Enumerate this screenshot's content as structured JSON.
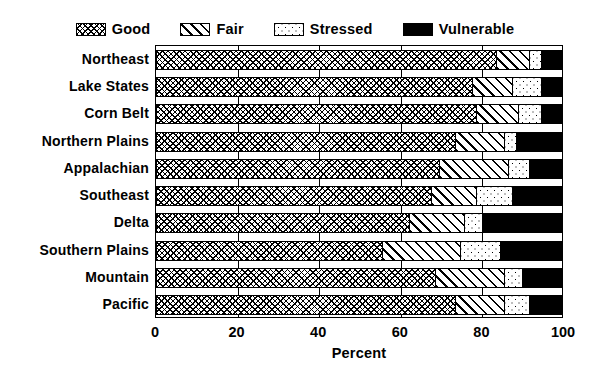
{
  "chart_data": {
    "type": "bar",
    "orientation": "horizontal",
    "stacked": true,
    "title": "",
    "xlabel": "Percent",
    "ylabel": "",
    "xlim": [
      0,
      100
    ],
    "xticks": [
      0,
      20,
      40,
      60,
      80,
      100
    ],
    "grid": true,
    "legend_position": "top",
    "categories": [
      "Northeast",
      "Lake States",
      "Corn Belt",
      "Northern Plains",
      "Appalachian",
      "Southeast",
      "Delta",
      "Southern Plains",
      "Mountain",
      "Pacific"
    ],
    "series": [
      {
        "name": "Good",
        "pattern": "crosshatch",
        "values": [
          84,
          78,
          79,
          74,
          70,
          68,
          62.5,
          56,
          69,
          74
        ]
      },
      {
        "name": "Fair",
        "pattern": "diagonal-lines",
        "values": [
          8,
          10,
          10.5,
          12,
          17,
          11,
          13.5,
          19,
          17,
          12
        ]
      },
      {
        "name": "Stressed",
        "pattern": "dots",
        "values": [
          3,
          7,
          5.5,
          3,
          5,
          9,
          4.5,
          10,
          4.5,
          6
        ]
      },
      {
        "name": "Vulnerable",
        "pattern": "solid-black",
        "values": [
          5,
          5,
          5,
          11,
          8,
          12,
          19.5,
          15,
          9.5,
          8
        ]
      }
    ]
  },
  "legend": {
    "items": [
      {
        "label": "Good",
        "pattern": "crosshatch"
      },
      {
        "label": "Fair",
        "pattern": "diagonal-lines"
      },
      {
        "label": "Stressed",
        "pattern": "dots"
      },
      {
        "label": "Vulnerable",
        "pattern": "solid-black"
      }
    ]
  },
  "colors": {
    "ink": "#000000",
    "background": "#ffffff"
  }
}
